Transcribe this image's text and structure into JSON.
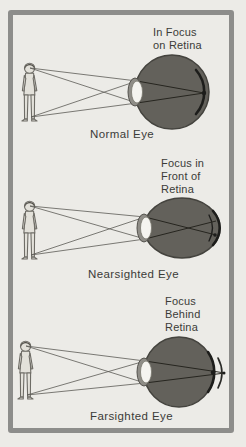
{
  "diagram": {
    "panels": [
      {
        "focus_label": {
          "lines": [
            "In Focus",
            "on Retina"
          ]
        },
        "caption": "Normal Eye",
        "focus_location": "on retina"
      },
      {
        "focus_label": {
          "lines": [
            "Focus in",
            "Front of",
            "Retina"
          ]
        },
        "caption": "Nearsighted Eye",
        "focus_location": "in front of retina"
      },
      {
        "focus_label": {
          "lines": [
            "Focus",
            "Behind",
            "Retina"
          ]
        },
        "caption": "Farsighted Eye",
        "focus_location": "behind retina"
      }
    ],
    "colors": {
      "background": "#ecebe7",
      "frame_border": "#8d8d8b",
      "eye_fill": "#63615b",
      "eye_outline": "#44433e",
      "retina": "#1d1d1b",
      "lens": "#f5f4f0",
      "ray": "#5c5a55",
      "text": "#3b3b38"
    }
  }
}
